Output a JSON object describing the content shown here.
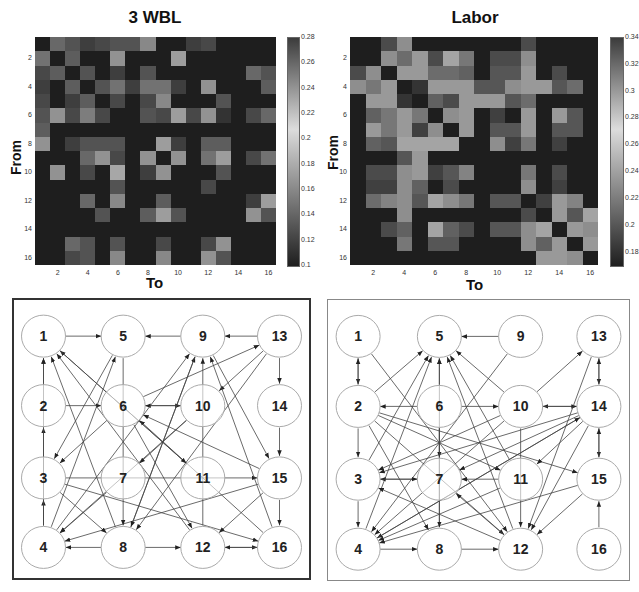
{
  "chart_data": [
    {
      "type": "heatmap",
      "title": "3 WBL",
      "xlabel": "To",
      "ylabel": "From",
      "x_ticks": [
        "2",
        "4",
        "6",
        "8",
        "10",
        "12",
        "14",
        "16"
      ],
      "y_ticks": [
        "2",
        "4",
        "6",
        "8",
        "10",
        "12",
        "14",
        "16"
      ],
      "colorbar": {
        "min": 0.1,
        "max": 0.28,
        "ticks": [
          "0.28",
          "0.26",
          "0.24",
          "0.22",
          "0.2",
          "0.18",
          "0.16",
          "0.14",
          "0.12",
          "0.1"
        ]
      },
      "matrix": [
        [
          0.1,
          0.17,
          0.15,
          0.13,
          0.14,
          0.15,
          0.15,
          0.2,
          0.1,
          0.1,
          0.13,
          0.14,
          0.1,
          0.1,
          0.1,
          0.1
        ],
        [
          0.18,
          0.1,
          0.16,
          0.1,
          0.1,
          0.21,
          0.1,
          0.1,
          0.1,
          0.22,
          0.1,
          0.1,
          0.1,
          0.1,
          0.1,
          0.1
        ],
        [
          0.14,
          0.16,
          0.1,
          0.15,
          0.1,
          0.13,
          0.1,
          0.15,
          0.1,
          0.1,
          0.1,
          0.1,
          0.1,
          0.1,
          0.17,
          0.15
        ],
        [
          0.13,
          0.1,
          0.16,
          0.1,
          0.15,
          0.18,
          0.13,
          0.18,
          0.18,
          0.13,
          0.1,
          0.21,
          0.1,
          0.1,
          0.1,
          0.16
        ],
        [
          0.14,
          0.1,
          0.13,
          0.16,
          0.1,
          0.14,
          0.1,
          0.14,
          0.2,
          0.1,
          0.1,
          0.1,
          0.15,
          0.1,
          0.1,
          0.1
        ],
        [
          0.15,
          0.21,
          0.14,
          0.19,
          0.14,
          0.1,
          0.1,
          0.15,
          0.14,
          0.22,
          0.14,
          0.21,
          0.12,
          0.1,
          0.14,
          0.17
        ],
        [
          0.16,
          0.1,
          0.1,
          0.1,
          0.1,
          0.1,
          0.1,
          0.1,
          0.1,
          0.1,
          0.1,
          0.1,
          0.1,
          0.1,
          0.1,
          0.1
        ],
        [
          0.21,
          0.1,
          0.13,
          0.15,
          0.15,
          0.15,
          0.1,
          0.1,
          0.22,
          0.13,
          0.1,
          0.16,
          0.16,
          0.1,
          0.1,
          0.1
        ],
        [
          0.1,
          0.1,
          0.1,
          0.17,
          0.21,
          0.14,
          0.1,
          0.21,
          0.1,
          0.21,
          0.1,
          0.18,
          0.22,
          0.1,
          0.14,
          0.18
        ],
        [
          0.1,
          0.21,
          0.1,
          0.14,
          0.1,
          0.23,
          0.1,
          0.13,
          0.21,
          0.1,
          0.1,
          0.1,
          0.15,
          0.1,
          0.1,
          0.1
        ],
        [
          0.1,
          0.1,
          0.1,
          0.1,
          0.1,
          0.15,
          0.1,
          0.1,
          0.1,
          0.1,
          0.1,
          0.14,
          0.1,
          0.1,
          0.1,
          0.1
        ],
        [
          0.1,
          0.1,
          0.1,
          0.17,
          0.1,
          0.2,
          0.1,
          0.1,
          0.16,
          0.1,
          0.1,
          0.1,
          0.1,
          0.1,
          0.13,
          0.22
        ],
        [
          0.1,
          0.1,
          0.1,
          0.1,
          0.15,
          0.1,
          0.1,
          0.16,
          0.22,
          0.15,
          0.1,
          0.1,
          0.1,
          0.1,
          0.21,
          0.15
        ],
        [
          0.1,
          0.1,
          0.1,
          0.1,
          0.1,
          0.1,
          0.1,
          0.1,
          0.1,
          0.1,
          0.1,
          0.1,
          0.1,
          0.1,
          0.1,
          0.1
        ],
        [
          0.1,
          0.1,
          0.17,
          0.15,
          0.1,
          0.15,
          0.1,
          0.1,
          0.14,
          0.1,
          0.1,
          0.14,
          0.21,
          0.1,
          0.1,
          0.1
        ],
        [
          0.1,
          0.1,
          0.14,
          0.15,
          0.1,
          0.2,
          0.1,
          0.1,
          0.2,
          0.1,
          0.1,
          0.21,
          0.15,
          0.1,
          0.1,
          0.1
        ]
      ]
    },
    {
      "type": "heatmap",
      "title": "Labor",
      "xlabel": "To",
      "ylabel": "From",
      "x_ticks": [
        "2",
        "4",
        "6",
        "8",
        "10",
        "12",
        "14",
        "16"
      ],
      "y_ticks": [
        "2",
        "4",
        "6",
        "8",
        "10",
        "12",
        "14",
        "16"
      ],
      "colorbar": {
        "min": 0.17,
        "max": 0.34,
        "ticks": [
          "0.34",
          "0.32",
          "0.3",
          "0.28",
          "0.26",
          "0.24",
          "0.22",
          "0.2",
          "0.18"
        ]
      },
      "matrix": [
        [
          0.17,
          0.17,
          0.21,
          0.27,
          0.17,
          0.17,
          0.17,
          0.17,
          0.17,
          0.17,
          0.17,
          0.21,
          0.17,
          0.17,
          0.17,
          0.17
        ],
        [
          0.17,
          0.17,
          0.27,
          0.24,
          0.28,
          0.21,
          0.29,
          0.25,
          0.17,
          0.21,
          0.21,
          0.27,
          0.17,
          0.17,
          0.17,
          0.17
        ],
        [
          0.21,
          0.27,
          0.17,
          0.28,
          0.28,
          0.24,
          0.24,
          0.23,
          0.17,
          0.22,
          0.22,
          0.28,
          0.17,
          0.21,
          0.17,
          0.17
        ],
        [
          0.27,
          0.25,
          0.28,
          0.17,
          0.19,
          0.28,
          0.28,
          0.28,
          0.22,
          0.22,
          0.27,
          0.28,
          0.28,
          0.22,
          0.24,
          0.17
        ],
        [
          0.17,
          0.28,
          0.28,
          0.19,
          0.17,
          0.23,
          0.21,
          0.28,
          0.28,
          0.28,
          0.22,
          0.24,
          0.17,
          0.17,
          0.17,
          0.17
        ],
        [
          0.17,
          0.23,
          0.25,
          0.28,
          0.25,
          0.17,
          0.27,
          0.28,
          0.17,
          0.2,
          0.17,
          0.28,
          0.17,
          0.28,
          0.22,
          0.17
        ],
        [
          0.17,
          0.28,
          0.25,
          0.28,
          0.2,
          0.27,
          0.17,
          0.28,
          0.17,
          0.22,
          0.22,
          0.28,
          0.17,
          0.22,
          0.22,
          0.17
        ],
        [
          0.17,
          0.23,
          0.22,
          0.29,
          0.29,
          0.29,
          0.29,
          0.17,
          0.17,
          0.27,
          0.2,
          0.25,
          0.17,
          0.2,
          0.17,
          0.17
        ],
        [
          0.17,
          0.17,
          0.17,
          0.22,
          0.28,
          0.17,
          0.17,
          0.17,
          0.17,
          0.17,
          0.17,
          0.17,
          0.17,
          0.17,
          0.17,
          0.17
        ],
        [
          0.17,
          0.21,
          0.21,
          0.27,
          0.28,
          0.2,
          0.22,
          0.26,
          0.17,
          0.17,
          0.17,
          0.25,
          0.17,
          0.21,
          0.17,
          0.17
        ],
        [
          0.17,
          0.2,
          0.2,
          0.27,
          0.23,
          0.17,
          0.21,
          0.17,
          0.17,
          0.17,
          0.17,
          0.27,
          0.17,
          0.2,
          0.17,
          0.17
        ],
        [
          0.17,
          0.24,
          0.26,
          0.27,
          0.22,
          0.29,
          0.27,
          0.25,
          0.17,
          0.22,
          0.22,
          0.17,
          0.2,
          0.28,
          0.26,
          0.17
        ],
        [
          0.17,
          0.17,
          0.17,
          0.27,
          0.17,
          0.17,
          0.17,
          0.17,
          0.17,
          0.17,
          0.17,
          0.21,
          0.17,
          0.28,
          0.22,
          0.29
        ],
        [
          0.17,
          0.17,
          0.21,
          0.23,
          0.17,
          0.29,
          0.23,
          0.21,
          0.17,
          0.22,
          0.22,
          0.27,
          0.29,
          0.17,
          0.28,
          0.27
        ],
        [
          0.17,
          0.17,
          0.17,
          0.25,
          0.17,
          0.22,
          0.22,
          0.17,
          0.17,
          0.17,
          0.17,
          0.27,
          0.23,
          0.28,
          0.17,
          0.28
        ],
        [
          0.17,
          0.17,
          0.17,
          0.17,
          0.17,
          0.17,
          0.17,
          0.17,
          0.17,
          0.17,
          0.17,
          0.17,
          0.28,
          0.28,
          0.27,
          0.17
        ]
      ]
    },
    {
      "type": "diagram",
      "title": "3 WBL network",
      "nodes": [
        "1",
        "2",
        "3",
        "4",
        "5",
        "6",
        "7",
        "8",
        "9",
        "10",
        "11",
        "12",
        "13",
        "14",
        "15",
        "16"
      ],
      "edges": [
        [
          1,
          5
        ],
        [
          9,
          5
        ],
        [
          13,
          9
        ],
        [
          2,
          6
        ],
        [
          6,
          10
        ],
        [
          10,
          6
        ],
        [
          4,
          2
        ],
        [
          2,
          1
        ],
        [
          4,
          3
        ],
        [
          3,
          15
        ],
        [
          14,
          15
        ],
        [
          13,
          14
        ],
        [
          15,
          16
        ],
        [
          8,
          12
        ],
        [
          12,
          16
        ],
        [
          16,
          12
        ],
        [
          8,
          4
        ],
        [
          15,
          4
        ],
        [
          5,
          3
        ],
        [
          4,
          5
        ],
        [
          6,
          3
        ],
        [
          4,
          1
        ],
        [
          8,
          1
        ],
        [
          11,
          1
        ],
        [
          12,
          1
        ],
        [
          6,
          13
        ],
        [
          10,
          4
        ],
        [
          13,
          10
        ],
        [
          13,
          8
        ],
        [
          4,
          9
        ],
        [
          8,
          9
        ],
        [
          10,
          7
        ],
        [
          7,
          4
        ],
        [
          3,
          16
        ],
        [
          3,
          8
        ],
        [
          15,
          6
        ],
        [
          16,
          9
        ],
        [
          9,
          15
        ],
        [
          16,
          6
        ],
        [
          15,
          12
        ],
        [
          9,
          8
        ],
        [
          12,
          9
        ],
        [
          1,
          11
        ],
        [
          5,
          8
        ],
        [
          6,
          12
        ]
      ]
    },
    {
      "type": "diagram",
      "title": "Labor network",
      "nodes": [
        "1",
        "2",
        "3",
        "4",
        "5",
        "6",
        "7",
        "8",
        "9",
        "10",
        "11",
        "12",
        "13",
        "14",
        "15",
        "16"
      ],
      "edges": [
        [
          9,
          5
        ],
        [
          2,
          5
        ],
        [
          10,
          5
        ],
        [
          6,
          5
        ],
        [
          1,
          2
        ],
        [
          2,
          1
        ],
        [
          2,
          3
        ],
        [
          3,
          4
        ],
        [
          6,
          2
        ],
        [
          6,
          10
        ],
        [
          14,
          10
        ],
        [
          10,
          14
        ],
        [
          10,
          13
        ],
        [
          13,
          14
        ],
        [
          14,
          13
        ],
        [
          14,
          15
        ],
        [
          15,
          14
        ],
        [
          16,
          15
        ],
        [
          4,
          8
        ],
        [
          8,
          12
        ],
        [
          1,
          12
        ],
        [
          9,
          4
        ],
        [
          14,
          3
        ],
        [
          14,
          4
        ],
        [
          14,
          7
        ],
        [
          14,
          12
        ],
        [
          15,
          4
        ],
        [
          15,
          12
        ],
        [
          13,
          12
        ],
        [
          3,
          5
        ],
        [
          4,
          5
        ],
        [
          8,
          5
        ],
        [
          12,
          5
        ],
        [
          11,
          5
        ],
        [
          2,
          12
        ],
        [
          2,
          11
        ],
        [
          2,
          8
        ],
        [
          2,
          15
        ],
        [
          6,
          7
        ],
        [
          6,
          8
        ],
        [
          7,
          3
        ],
        [
          11,
          7
        ],
        [
          10,
          4
        ],
        [
          10,
          3
        ],
        [
          11,
          4
        ],
        [
          12,
          7
        ],
        [
          12,
          3
        ],
        [
          14,
          11
        ],
        [
          3,
          7
        ],
        [
          10,
          12
        ],
        [
          4,
          14
        ]
      ]
    }
  ],
  "panels": {
    "left_title": "3 WBL",
    "right_title": "Labor",
    "xlabel": "To",
    "ylabel": "From"
  }
}
